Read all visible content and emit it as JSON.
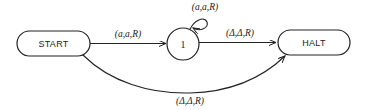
{
  "diagram": {
    "type": "turing-machine-state-diagram",
    "states": [
      {
        "id": "start",
        "label": "START",
        "shape": "rounded-rectangle"
      },
      {
        "id": "q1",
        "label": "1",
        "shape": "circle"
      },
      {
        "id": "halt",
        "label": "HALT",
        "shape": "rounded-rectangle"
      }
    ],
    "transitions": [
      {
        "from": "start",
        "to": "q1",
        "label": "(a,a,R)"
      },
      {
        "from": "q1",
        "to": "q1",
        "label": "(a,a,R)"
      },
      {
        "from": "q1",
        "to": "halt",
        "label": "(Δ,Δ,R)"
      },
      {
        "from": "start",
        "to": "halt",
        "label": "(Δ,Δ,R)"
      }
    ]
  },
  "colors": {
    "stroke": "#222222",
    "background": "#ffffff"
  }
}
